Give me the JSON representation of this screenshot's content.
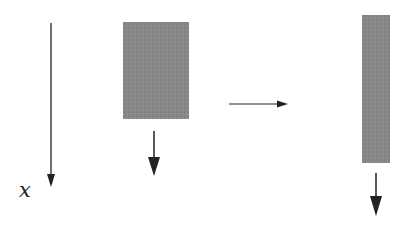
{
  "diagram": {
    "axis": {
      "label": "x",
      "direction": "down"
    },
    "blocks": [
      {
        "name": "initial-block",
        "shape": "wide-rectangle",
        "fill": "#888888",
        "arrow": "down"
      },
      {
        "name": "stretched-block",
        "shape": "tall-narrow-rectangle",
        "fill": "#888888",
        "arrow": "down"
      }
    ],
    "transition_arrow": {
      "direction": "right"
    },
    "colors": {
      "line": "#222222",
      "block_fill": "#888888",
      "background": "#ffffff"
    }
  }
}
